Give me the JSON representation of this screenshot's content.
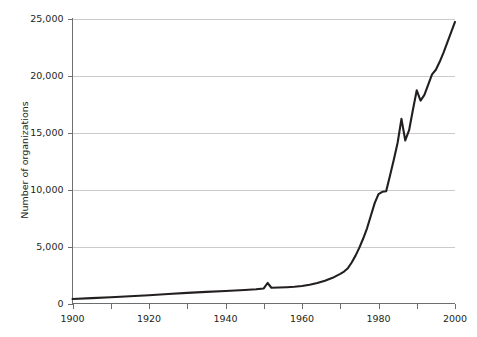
{
  "chart_data": {
    "type": "line",
    "title": "",
    "subtitle": "",
    "xlabel": "",
    "ylabel": "Number of organizations",
    "xlim": [
      1900,
      2000
    ],
    "ylim": [
      0,
      25000
    ],
    "grid": "horizontal",
    "legend": "none",
    "x_ticks_major": [
      1900,
      1920,
      1940,
      1960,
      1980,
      2000
    ],
    "x_ticks_major_labels": [
      "1900",
      "1920",
      "1940",
      "1960",
      "1980",
      "2000"
    ],
    "x_ticks_minor": [
      1910,
      1930,
      1950,
      1970,
      1990
    ],
    "y_ticks": [
      0,
      5000,
      10000,
      15000,
      20000,
      25000
    ],
    "y_tick_labels": [
      "0",
      "5,000",
      "10,000",
      "15,000",
      "20,000",
      "25,000"
    ],
    "line_color": "#231f20",
    "gridline_color": "#c9cacc",
    "axis_color": "#6d6e71",
    "background_color": "#ffffff",
    "series": [
      {
        "name": "Number of organizations",
        "x": [
          1900,
          1905,
          1910,
          1915,
          1920,
          1925,
          1930,
          1935,
          1940,
          1945,
          1948,
          1950,
          1951,
          1952,
          1954,
          1956,
          1958,
          1960,
          1962,
          1964,
          1966,
          1968,
          1970,
          1971,
          1972,
          1973,
          1974,
          1975,
          1976,
          1977,
          1978,
          1979,
          1980,
          1981,
          1982,
          1983,
          1984,
          1985,
          1986,
          1987,
          1988,
          1989,
          1990,
          1991,
          1992,
          1993,
          1994,
          1995,
          1996,
          1997,
          1998,
          1999,
          2000
        ],
        "values": [
          400,
          470,
          550,
          640,
          730,
          830,
          930,
          1020,
          1100,
          1180,
          1250,
          1320,
          1800,
          1380,
          1400,
          1430,
          1470,
          1530,
          1640,
          1800,
          2000,
          2250,
          2600,
          2800,
          3100,
          3600,
          4200,
          4900,
          5700,
          6600,
          7700,
          8800,
          9600,
          9800,
          9850,
          11200,
          12600,
          14100,
          16200,
          14300,
          15200,
          17000,
          18700,
          17800,
          18300,
          19200,
          20100,
          20500,
          21200,
          22000,
          22900,
          23800,
          24700
        ]
      }
    ]
  },
  "axis": {
    "y_title": "Number of organizations"
  }
}
